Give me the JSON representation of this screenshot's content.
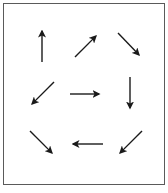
{
  "diagram": {
    "title": "",
    "stroke_color": "#1a1a1a",
    "border_color": "#5a5a5a",
    "arrows": [
      {
        "row": 1,
        "col": 1,
        "direction": "up",
        "x1": 42,
        "y1": 62,
        "x2": 42,
        "y2": 28
      },
      {
        "row": 1,
        "col": 2,
        "direction": "up-right",
        "x1": 75,
        "y1": 57,
        "x2": 98,
        "y2": 34
      },
      {
        "row": 1,
        "col": 3,
        "direction": "down-right",
        "x1": 118,
        "y1": 33,
        "x2": 141,
        "y2": 57
      },
      {
        "row": 2,
        "col": 1,
        "direction": "down-left",
        "x1": 54,
        "y1": 82,
        "x2": 30,
        "y2": 106
      },
      {
        "row": 2,
        "col": 2,
        "direction": "right",
        "x1": 70,
        "y1": 94,
        "x2": 102,
        "y2": 94
      },
      {
        "row": 2,
        "col": 3,
        "direction": "down",
        "x1": 130,
        "y1": 77,
        "x2": 130,
        "y2": 111
      },
      {
        "row": 3,
        "col": 1,
        "direction": "down-right",
        "x1": 30,
        "y1": 131,
        "x2": 54,
        "y2": 155
      },
      {
        "row": 3,
        "col": 2,
        "direction": "left",
        "x1": 103,
        "y1": 144,
        "x2": 70,
        "y2": 144
      },
      {
        "row": 3,
        "col": 3,
        "direction": "down-left",
        "x1": 142,
        "y1": 131,
        "x2": 118,
        "y2": 155
      }
    ]
  }
}
